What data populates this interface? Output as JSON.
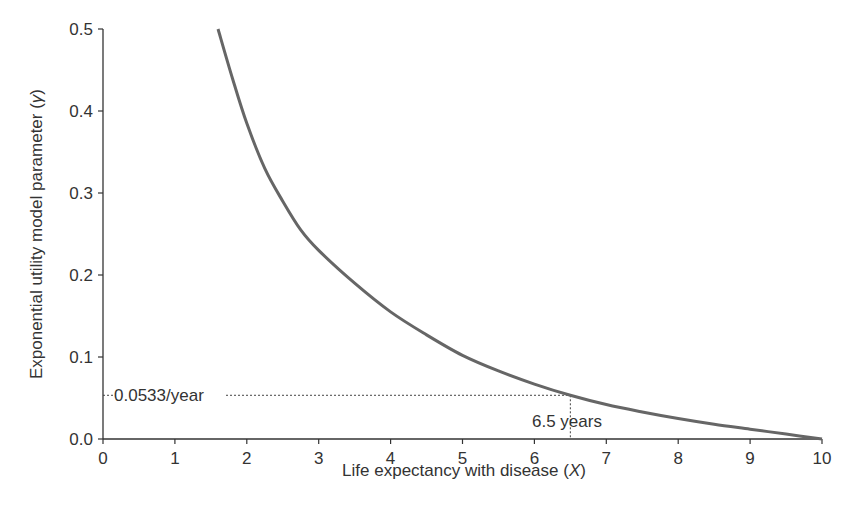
{
  "chart_data": {
    "type": "line",
    "title": "",
    "xlabel": "Life expectancy with disease (X)",
    "ylabel": "Exponential utility model parameter (γ)",
    "xlim": [
      0,
      10
    ],
    "ylim": [
      0,
      0.5
    ],
    "x_ticks": [
      "0",
      "1",
      "2",
      "3",
      "4",
      "5",
      "6",
      "7",
      "8",
      "9",
      "10"
    ],
    "y_ticks": [
      "0.0",
      "0.1",
      "0.2",
      "0.3",
      "0.4",
      "0.5"
    ],
    "grid": false,
    "legend": null,
    "series": [
      {
        "name": "gamma",
        "x": [
          1.6,
          1.8,
          2.0,
          2.25,
          2.5,
          2.75,
          3.0,
          3.5,
          4.0,
          4.5,
          5.0,
          5.5,
          6.0,
          6.5,
          7.0,
          7.5,
          8.0,
          8.5,
          9.0,
          9.5,
          10.0
        ],
        "values": [
          0.5,
          0.44,
          0.385,
          0.33,
          0.29,
          0.255,
          0.23,
          0.19,
          0.155,
          0.127,
          0.102,
          0.083,
          0.067,
          0.0533,
          0.042,
          0.033,
          0.025,
          0.018,
          0.012,
          0.006,
          0.0
        ]
      }
    ],
    "annotations": [
      {
        "text": "0.0533/year",
        "x": 0,
        "y": 0.0533,
        "type": "horizontal-dotted-guide"
      },
      {
        "text": "6.5 years",
        "x": 6.5,
        "y": 0,
        "type": "vertical-dotted-guide"
      }
    ]
  },
  "labels": {
    "xlabel_main": "Life expectancy with disease (",
    "xlabel_var": "X",
    "xlabel_end": ")",
    "ylabel_main": "Exponential utility model parameter (",
    "ylabel_var": "γ",
    "ylabel_end": ")",
    "anno_y": "0.0533/year",
    "anno_x": "6.5 years"
  },
  "colors": {
    "curve": "#666666",
    "axis": "#333333",
    "guide": "#444444"
  }
}
